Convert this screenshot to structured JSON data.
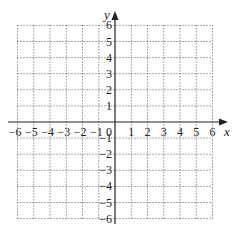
{
  "chart_data": {
    "type": "scatter",
    "title": "",
    "xlabel": "x",
    "ylabel": "y",
    "xlim": [
      -6,
      6
    ],
    "ylim": [
      -6,
      6
    ],
    "grid": true,
    "grid_style": "dotted",
    "x_ticks": [
      -6,
      -5,
      -4,
      -3,
      -2,
      -1,
      0,
      1,
      2,
      3,
      4,
      5,
      6
    ],
    "y_ticks": [
      -6,
      -5,
      -4,
      -3,
      -2,
      -1,
      1,
      2,
      3,
      4,
      5,
      6
    ],
    "x_tick_labels": [
      "−6",
      "−5",
      "−4",
      "−3",
      "−2",
      "−1",
      "0",
      "1",
      "2",
      "3",
      "4",
      "5",
      "6"
    ],
    "y_tick_labels": [
      "6",
      "5",
      "4",
      "3",
      "2",
      "1",
      "−1",
      "−2",
      "−3",
      "−4",
      "−5",
      "−6"
    ],
    "series": []
  },
  "colors": {
    "axis": "#222222",
    "grid": "#555555",
    "background": "#ffffff"
  }
}
